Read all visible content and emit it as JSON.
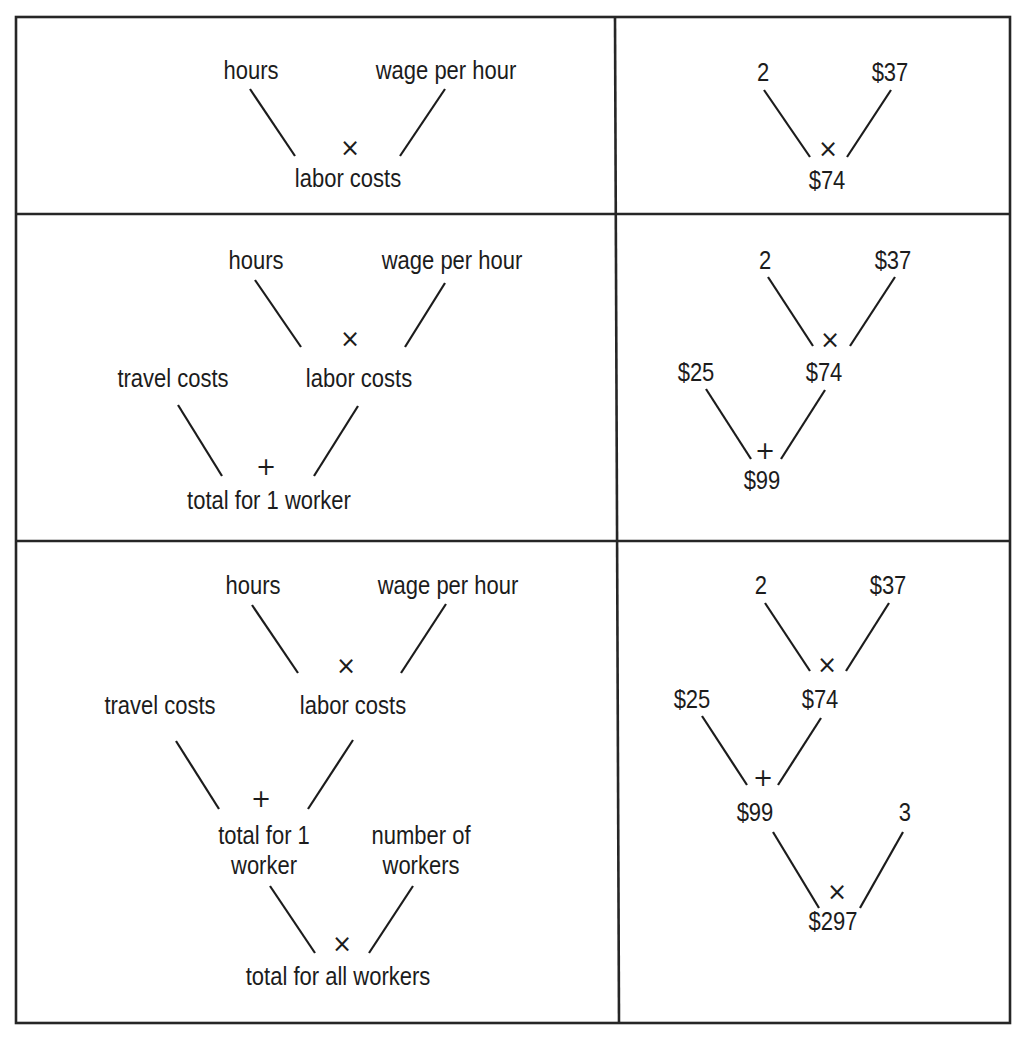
{
  "table": {
    "rows": [
      {
        "label_tree": {
          "nodes": [
            {
              "id": "hours",
              "text": "hours",
              "x": 251,
              "y": 79
            },
            {
              "id": "wage",
              "text": "wage per hour",
              "x": 446,
              "y": 79
            },
            {
              "id": "labor",
              "text": "labor costs",
              "x": 348,
              "y": 187
            }
          ],
          "operators": [
            {
              "symbol": "×",
              "x": 350,
              "y": 156
            }
          ],
          "edges": [
            {
              "from": "hours",
              "to": "labor",
              "x1": 250,
              "y1": 89,
              "x2": 295,
              "y2": 156
            },
            {
              "from": "wage",
              "to": "labor",
              "x1": 445,
              "y1": 89,
              "x2": 400,
              "y2": 156
            }
          ]
        },
        "value_tree": {
          "nodes": [
            {
              "id": "hours_v",
              "text": "2",
              "x": 763,
              "y": 81
            },
            {
              "id": "wage_v",
              "text": "$37",
              "x": 890,
              "y": 81
            },
            {
              "id": "labor_v",
              "text": "$74",
              "x": 827,
              "y": 189
            }
          ],
          "operators": [
            {
              "symbol": "×",
              "x": 828,
              "y": 157
            }
          ],
          "edges": [
            {
              "x1": 764,
              "y1": 90,
              "x2": 810,
              "y2": 157
            },
            {
              "x1": 891,
              "y1": 90,
              "x2": 847,
              "y2": 157
            }
          ]
        }
      },
      {
        "label_tree": {
          "nodes": [
            {
              "id": "hours",
              "text": "hours",
              "x": 256,
              "y": 269
            },
            {
              "id": "wage",
              "text": "wage per hour",
              "x": 452,
              "y": 269
            },
            {
              "id": "travel",
              "text": "travel costs",
              "x": 173,
              "y": 387
            },
            {
              "id": "labor",
              "text": "labor costs",
              "x": 359,
              "y": 387
            },
            {
              "id": "total1",
              "text": "total for 1 worker",
              "x": 269,
              "y": 509
            }
          ],
          "operators": [
            {
              "symbol": "×",
              "x": 350,
              "y": 347
            },
            {
              "symbol": "+",
              "x": 266,
              "y": 475
            }
          ],
          "edges": [
            {
              "x1": 255,
              "y1": 280,
              "x2": 301,
              "y2": 347
            },
            {
              "x1": 445,
              "y1": 283,
              "x2": 405,
              "y2": 347
            },
            {
              "x1": 178,
              "y1": 405,
              "x2": 222,
              "y2": 476
            },
            {
              "x1": 358,
              "y1": 406,
              "x2": 314,
              "y2": 476
            }
          ]
        },
        "value_tree": {
          "nodes": [
            {
              "id": "hours_v",
              "text": "2",
              "x": 765,
              "y": 269
            },
            {
              "id": "wage_v",
              "text": "$37",
              "x": 893,
              "y": 269
            },
            {
              "id": "travel_v",
              "text": "$25",
              "x": 696,
              "y": 381
            },
            {
              "id": "labor_v",
              "text": "$74",
              "x": 824,
              "y": 381
            },
            {
              "id": "total1_v",
              "text": "$99",
              "x": 762,
              "y": 489
            }
          ],
          "operators": [
            {
              "symbol": "×",
              "x": 830,
              "y": 348
            },
            {
              "symbol": "+",
              "x": 765,
              "y": 459
            }
          ],
          "edges": [
            {
              "x1": 768,
              "y1": 277,
              "x2": 813,
              "y2": 346
            },
            {
              "x1": 895,
              "y1": 277,
              "x2": 850,
              "y2": 346
            },
            {
              "x1": 706,
              "y1": 389,
              "x2": 751,
              "y2": 459
            },
            {
              "x1": 825,
              "y1": 390,
              "x2": 781,
              "y2": 459
            }
          ]
        }
      },
      {
        "label_tree": {
          "nodes": [
            {
              "id": "hours",
              "text": "hours",
              "x": 253,
              "y": 594
            },
            {
              "id": "wage",
              "text": "wage per hour",
              "x": 448,
              "y": 594
            },
            {
              "id": "travel",
              "text": "travel costs",
              "x": 160,
              "y": 714
            },
            {
              "id": "labor",
              "text": "labor costs",
              "x": 353,
              "y": 714
            },
            {
              "id": "total1_a",
              "text": "total for 1",
              "x": 264,
              "y": 844
            },
            {
              "id": "total1_b",
              "text": "worker",
              "x": 264,
              "y": 874
            },
            {
              "id": "nworkers_a",
              "text": "number of",
              "x": 421,
              "y": 844
            },
            {
              "id": "nworkers_b",
              "text": "workers",
              "x": 421,
              "y": 874
            },
            {
              "id": "totalall",
              "text": "total for all workers",
              "x": 338,
              "y": 985
            }
          ],
          "operators": [
            {
              "symbol": "×",
              "x": 346,
              "y": 674
            },
            {
              "symbol": "+",
              "x": 261,
              "y": 807
            },
            {
              "symbol": "×",
              "x": 342,
              "y": 952
            }
          ],
          "edges": [
            {
              "x1": 252,
              "y1": 605,
              "x2": 298,
              "y2": 673
            },
            {
              "x1": 446,
              "y1": 604,
              "x2": 401,
              "y2": 673
            },
            {
              "x1": 176,
              "y1": 741,
              "x2": 219,
              "y2": 809
            },
            {
              "x1": 353,
              "y1": 740,
              "x2": 308,
              "y2": 809
            },
            {
              "x1": 270,
              "y1": 886,
              "x2": 315,
              "y2": 953
            },
            {
              "x1": 413,
              "y1": 886,
              "x2": 369,
              "y2": 953
            }
          ]
        },
        "value_tree": {
          "nodes": [
            {
              "id": "hours_v",
              "text": "2",
              "x": 761,
              "y": 594
            },
            {
              "id": "wage_v",
              "text": "$37",
              "x": 888,
              "y": 594
            },
            {
              "id": "travel_v",
              "text": "$25",
              "x": 692,
              "y": 708
            },
            {
              "id": "labor_v",
              "text": "$74",
              "x": 820,
              "y": 708
            },
            {
              "id": "total1_v",
              "text": "$99",
              "x": 755,
              "y": 821
            },
            {
              "id": "nworkers_v",
              "text": "3",
              "x": 905,
              "y": 821
            },
            {
              "id": "totalall_v",
              "text": "$297",
              "x": 833,
              "y": 930
            }
          ],
          "operators": [
            {
              "symbol": "×",
              "x": 827,
              "y": 673
            },
            {
              "symbol": "+",
              "x": 763,
              "y": 786
            },
            {
              "symbol": "×",
              "x": 837,
              "y": 900
            }
          ],
          "edges": [
            {
              "x1": 765,
              "y1": 603,
              "x2": 810,
              "y2": 671
            },
            {
              "x1": 889,
              "y1": 603,
              "x2": 846,
              "y2": 671
            },
            {
              "x1": 702,
              "y1": 716,
              "x2": 747,
              "y2": 785
            },
            {
              "x1": 821,
              "y1": 718,
              "x2": 778,
              "y2": 785
            },
            {
              "x1": 773,
              "y1": 832,
              "x2": 819,
              "y2": 908
            },
            {
              "x1": 903,
              "y1": 832,
              "x2": 860,
              "y2": 908
            }
          ]
        }
      }
    ],
    "grid": {
      "left": 16,
      "top": 17,
      "right": 1010,
      "bottom": 1023,
      "row_dividers": [
        214,
        541
      ],
      "col_divider_top": 615,
      "col_divider_bottom": 619
    }
  }
}
